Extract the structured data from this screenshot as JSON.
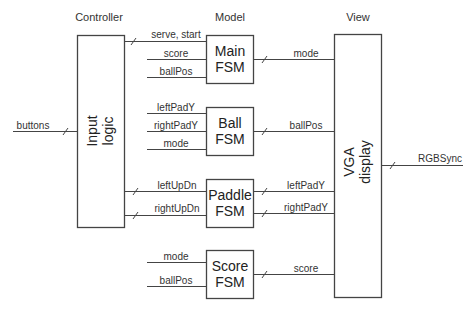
{
  "sections": {
    "controller": "Controller",
    "model": "Model",
    "view": "View"
  },
  "blocks": {
    "input_logic": {
      "line1": "Input",
      "line2": "logic"
    },
    "main_fsm": {
      "line1": "Main",
      "line2": "FSM"
    },
    "ball_fsm": {
      "line1": "Ball",
      "line2": "FSM"
    },
    "paddle_fsm": {
      "line1": "Paddle",
      "line2": "FSM"
    },
    "score_fsm": {
      "line1": "Score",
      "line2": "FSM"
    },
    "vga_display": {
      "line1": "VGA",
      "line2": "display"
    }
  },
  "signals": {
    "buttons": "buttons",
    "serve_start": "serve, start",
    "main_in_score": "score",
    "main_in_ballpos": "ballPos",
    "main_out_mode": "mode",
    "ball_in_leftpady": "leftPadY",
    "ball_in_rightpady": "rightPadY",
    "ball_in_mode": "mode",
    "ball_out_ballpos": "ballPos",
    "left_updn": "leftUpDn",
    "right_updn": "rightUpDn",
    "paddle_out_leftpady": "leftPadY",
    "paddle_out_rightpady": "rightPadY",
    "score_in_mode": "mode",
    "score_in_ballpos": "ballPos",
    "score_out_score": "score",
    "rgbsync": "RGBSync"
  }
}
